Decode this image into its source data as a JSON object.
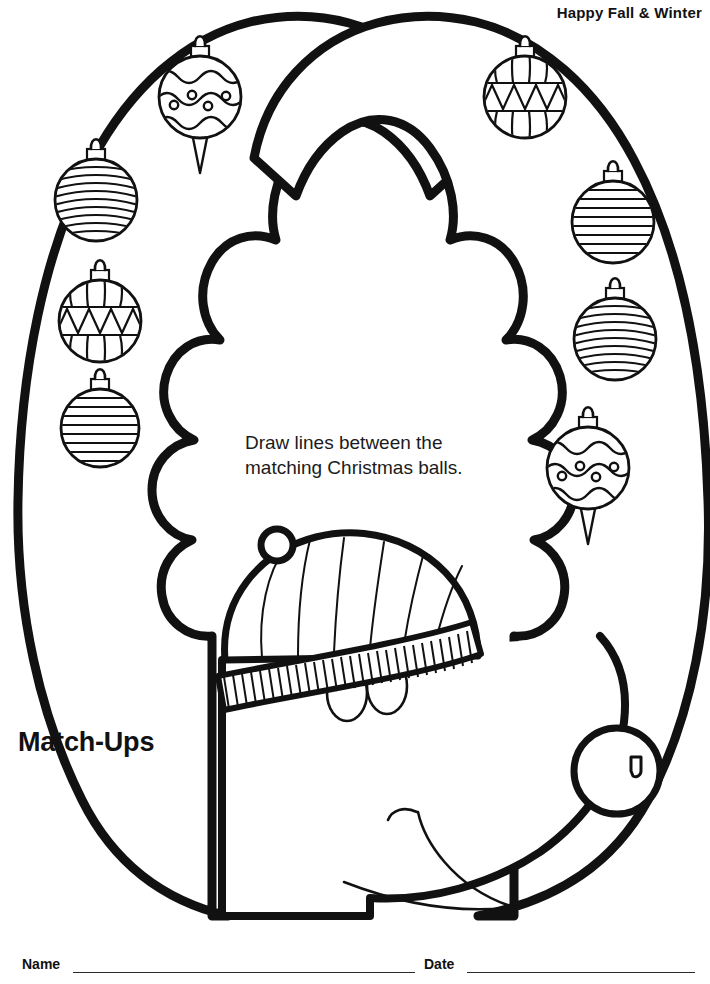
{
  "page": {
    "width": 710,
    "height": 984,
    "background": "#ffffff",
    "ink_color": "#111111"
  },
  "header": {
    "text": "Happy Fall & Winter"
  },
  "title": {
    "text": "Match-Ups"
  },
  "instructions": {
    "line1": "Draw lines between the",
    "line2": "matching Christmas balls."
  },
  "artwork": {
    "subject": "reindeer-with-winter-hat",
    "description": "Line-art reindeer head wearing a striped knit beanie, with two large antlers each holding four Christmas ornaments.",
    "hat": {
      "name": "knit-beanie",
      "panels": 9,
      "brim_ribs": 56,
      "pompom_loop": true
    },
    "face": {
      "eyes": 2,
      "nose": "round-nose-with-nostril",
      "mouth": "curved-smile"
    }
  },
  "ornaments": {
    "left_antler": [
      {
        "id": "left-1",
        "pattern": "wavy-dots",
        "shape": "teardrop-spike",
        "cx": 200,
        "cy": 97,
        "r": 42,
        "match": "right-4"
      },
      {
        "id": "left-2",
        "pattern": "curved-stripes",
        "shape": "round",
        "cx": 96,
        "cy": 200,
        "r": 42,
        "match": "right-3"
      },
      {
        "id": "left-3",
        "pattern": "zigzag-band",
        "shape": "round",
        "cx": 100,
        "cy": 321,
        "r": 42,
        "match": "right-1"
      },
      {
        "id": "left-4",
        "pattern": "straight-stripes",
        "shape": "round",
        "cx": 100,
        "cy": 428,
        "r": 40,
        "match": "right-2"
      }
    ],
    "right_antler": [
      {
        "id": "right-1",
        "pattern": "zigzag-band",
        "shape": "round",
        "cx": 525,
        "cy": 97,
        "r": 42,
        "match": "left-3"
      },
      {
        "id": "right-2",
        "pattern": "straight-stripes",
        "shape": "round",
        "cx": 613,
        "cy": 222,
        "r": 42,
        "match": "left-4"
      },
      {
        "id": "right-3",
        "pattern": "curved-stripes",
        "shape": "round",
        "cx": 615,
        "cy": 339,
        "r": 42,
        "match": "left-2"
      },
      {
        "id": "right-4",
        "pattern": "wavy-dots",
        "shape": "teardrop-spike",
        "cx": 588,
        "cy": 468,
        "r": 42,
        "match": "left-1"
      }
    ]
  },
  "footer": {
    "name_label": "Name",
    "date_label": "Date"
  }
}
